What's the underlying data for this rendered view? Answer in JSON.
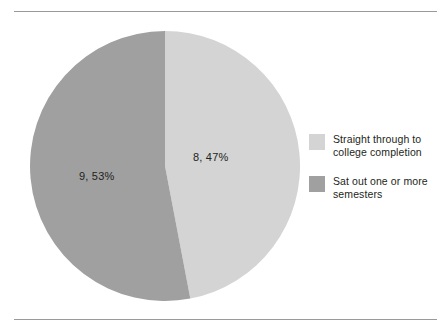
{
  "figure": {
    "background_color": "#ffffff",
    "rule_color": "#9a9a9a",
    "width": 445,
    "height": 332
  },
  "chart_data": {
    "type": "pie",
    "title": "",
    "subtitle": "",
    "xlabel": "",
    "ylabel": "",
    "grid": false,
    "legend_position": "right",
    "start_angle_deg": 0,
    "direction": "clockwise",
    "slices": [
      {
        "label": "Straight through to college completion",
        "data_label": "8, 47%",
        "count": 8,
        "percent": 47,
        "color": "#d4d4d4"
      },
      {
        "label": "Sat out one or more semesters",
        "data_label": "9, 53%",
        "count": 9,
        "percent": 53,
        "color": "#a0a0a0"
      }
    ],
    "total_count": 17
  },
  "legend": {
    "items": [
      {
        "swatch_color": "#d4d4d4",
        "line1": "Straight through to",
        "line2": "college completion"
      },
      {
        "swatch_color": "#a0a0a0",
        "line1": "Sat out one or more",
        "line2": "semesters"
      }
    ]
  }
}
